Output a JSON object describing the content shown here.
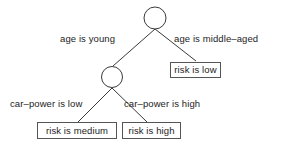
{
  "diagram": {
    "type": "decision-tree",
    "title": "",
    "background_color": "#ffffff",
    "line_color": "#3a3a3a",
    "box_border_color": "#555555",
    "text_color": "#1c1c1c",
    "nodes": [
      {
        "id": "root",
        "kind": "decision",
        "shape": "circle",
        "label": ""
      },
      {
        "id": "inner",
        "kind": "decision",
        "shape": "circle",
        "label": ""
      },
      {
        "id": "leaf_low",
        "kind": "leaf",
        "shape": "box",
        "label": "risk is low"
      },
      {
        "id": "leaf_medium",
        "kind": "leaf",
        "shape": "box",
        "label": "risk is medium"
      },
      {
        "id": "leaf_high",
        "kind": "leaf",
        "shape": "box",
        "label": "risk is high"
      }
    ],
    "edges": [
      {
        "from": "root",
        "to": "inner",
        "label": "age is young"
      },
      {
        "from": "root",
        "to": "leaf_low",
        "label": "age is middle–aged"
      },
      {
        "from": "inner",
        "to": "leaf_medium",
        "label": "car–power is low"
      },
      {
        "from": "inner",
        "to": "leaf_high",
        "label": "car–power is high"
      }
    ]
  }
}
